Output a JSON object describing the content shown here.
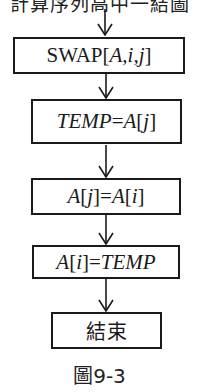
{
  "diagram": {
    "type": "flowchart",
    "top_text_clipped": "計算序列高中一結圖",
    "nodes": [
      {
        "id": "swap",
        "label": "SWAP[A,i,j]",
        "parts": {
          "prefix": "SWAP[",
          "italic_a": "A",
          "sep1": ",",
          "italic_i": "i",
          "sep2": ",",
          "italic_j": "j",
          "suffix": "]"
        }
      },
      {
        "id": "temp_assign",
        "label": "TEMP=A[j]",
        "parts": {
          "lhs": "TEMP",
          "eq": "=",
          "arr": "A",
          "open": "[",
          "idx": "j",
          "close": "]"
        }
      },
      {
        "id": "aj_assign",
        "label": "A[j]=A[i]",
        "parts": {
          "arr1": "A",
          "open1": "[",
          "idx1": "j",
          "close1": "]",
          "eq": "=",
          "arr2": "A",
          "open2": "[",
          "idx2": "i",
          "close2": "]"
        }
      },
      {
        "id": "ai_assign",
        "label": "A[i]=TEMP",
        "parts": {
          "arr": "A",
          "open": "[",
          "idx": "i",
          "close": "]",
          "eq": "=",
          "rhs": "TEMP"
        }
      },
      {
        "id": "end",
        "label": "結束"
      }
    ],
    "edges": [
      {
        "from": "top",
        "to": "swap"
      },
      {
        "from": "swap",
        "to": "temp_assign"
      },
      {
        "from": "temp_assign",
        "to": "aj_assign"
      },
      {
        "from": "aj_assign",
        "to": "ai_assign"
      },
      {
        "from": "ai_assign",
        "to": "end"
      }
    ],
    "caption": "圖9-3"
  }
}
